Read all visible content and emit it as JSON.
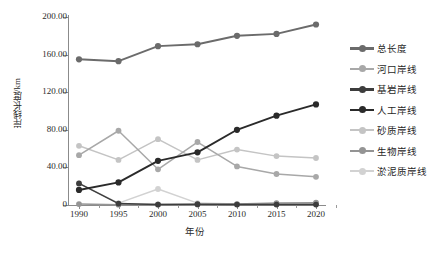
{
  "chart_data": {
    "type": "line",
    "title": "",
    "xlabel": "年份",
    "ylabel": "岸线长度/km",
    "categories": [
      "1990",
      "1995",
      "2000",
      "2005",
      "2010",
      "2015",
      "2020"
    ],
    "x": [
      1990,
      1995,
      2000,
      2005,
      2010,
      2015,
      2020
    ],
    "ylim": [
      0,
      200
    ],
    "yticks": [
      0,
      40,
      80,
      120,
      160,
      200
    ],
    "ytick_labels": [
      "0",
      "40.00",
      "80.00",
      "120.00",
      "160.00",
      "200.00"
    ],
    "grid": false,
    "legend_position": "right",
    "series": [
      {
        "name": "总长度",
        "color": "#6b6b6b",
        "values": [
          155.0,
          153.0,
          169.0,
          171.0,
          180.0,
          182.0,
          192.0
        ]
      },
      {
        "name": "河口岸线",
        "color": "#a8a8a8",
        "values": [
          53.0,
          79.0,
          38.0,
          67.0,
          41.0,
          33.0,
          30.0
        ]
      },
      {
        "name": "基岩岸线",
        "color": "#3d3d3d",
        "values": [
          23.0,
          1.5,
          0.5,
          0.8,
          0.5,
          0.5,
          0.4
        ]
      },
      {
        "name": "人工岸线",
        "color": "#2a2a2a",
        "values": [
          16.0,
          24.0,
          47.0,
          56.0,
          80.0,
          95.0,
          107.0
        ]
      },
      {
        "name": "砂质岸线",
        "color": "#c4c4c4",
        "values": [
          63.0,
          48.0,
          70.0,
          48.0,
          59.0,
          52.0,
          50.0
        ]
      },
      {
        "name": "生物岸线",
        "color": "#949494",
        "values": [
          1.0,
          0.3,
          0.6,
          0.6,
          1.0,
          2.0,
          2.5
        ]
      },
      {
        "name": "淤泥质岸线",
        "color": "#d2d2d2",
        "values": [
          23.0,
          2.0,
          17.0,
          2.0,
          1.0,
          1.0,
          2.0
        ]
      }
    ]
  },
  "axes": {
    "y_title": "岸线长度/km",
    "x_title": "年份",
    "y_tick_labels": [
      "200.00",
      "160.00",
      "120.00",
      "80.00",
      "40.00",
      "0"
    ],
    "x_tick_labels": [
      "1990",
      "1995",
      "2000",
      "2005",
      "2010",
      "2015",
      "2020"
    ]
  },
  "legend": {
    "items": [
      {
        "label": "总长度",
        "color": "#6b6b6b"
      },
      {
        "label": "河口岸线",
        "color": "#a8a8a8"
      },
      {
        "label": "基岩岸线",
        "color": "#3d3d3d"
      },
      {
        "label": "人工岸线",
        "color": "#2a2a2a"
      },
      {
        "label": "砂质岸线",
        "color": "#c4c4c4"
      },
      {
        "label": "生物岸线",
        "color": "#949494"
      },
      {
        "label": "淤泥质岸线",
        "color": "#d2d2d2"
      }
    ]
  }
}
